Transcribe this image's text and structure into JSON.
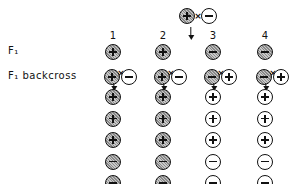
{
  "diagram": {
    "parents": [
      {
        "sign": "+",
        "fill": "shaded"
      },
      {
        "sign": "-",
        "fill": "open"
      }
    ],
    "cross_symbol": "×",
    "row_labels": {
      "f1": "F₁",
      "f1_backcross": "F₁ backcross"
    },
    "columns": [
      {
        "number": "1",
        "f1": {
          "sign": "+",
          "fill": "shaded"
        },
        "backcross": [
          {
            "sign": "+",
            "fill": "shaded"
          },
          {
            "sign": "-",
            "fill": "open"
          }
        ],
        "progeny": [
          {
            "sign": "+",
            "fill": "shaded"
          },
          {
            "sign": "+",
            "fill": "shaded"
          },
          {
            "sign": "+",
            "fill": "shaded"
          },
          {
            "sign": "-",
            "fill": "shaded"
          },
          {
            "sign": "-",
            "fill": "shaded"
          }
        ]
      },
      {
        "number": "2",
        "f1": {
          "sign": "+",
          "fill": "shaded"
        },
        "backcross": [
          {
            "sign": "+",
            "fill": "shaded"
          },
          {
            "sign": "-",
            "fill": "open"
          }
        ],
        "progeny": [
          {
            "sign": "+",
            "fill": "shaded"
          },
          {
            "sign": "+",
            "fill": "shaded"
          },
          {
            "sign": "+",
            "fill": "shaded"
          },
          {
            "sign": "-",
            "fill": "shaded"
          },
          {
            "sign": "-",
            "fill": "shaded"
          }
        ]
      },
      {
        "number": "3",
        "f1": {
          "sign": "-",
          "fill": "shaded"
        },
        "backcross": [
          {
            "sign": "-",
            "fill": "shaded"
          },
          {
            "sign": "+",
            "fill": "open"
          }
        ],
        "progeny": [
          {
            "sign": "+",
            "fill": "open"
          },
          {
            "sign": "+",
            "fill": "open"
          },
          {
            "sign": "+",
            "fill": "open"
          },
          {
            "sign": "-",
            "fill": "open"
          },
          {
            "sign": "-",
            "fill": "open"
          }
        ]
      },
      {
        "number": "4",
        "f1": {
          "sign": "-",
          "fill": "shaded"
        },
        "backcross": [
          {
            "sign": "-",
            "fill": "shaded"
          },
          {
            "sign": "+",
            "fill": "open"
          }
        ],
        "progeny": [
          {
            "sign": "+",
            "fill": "open"
          },
          {
            "sign": "+",
            "fill": "open"
          },
          {
            "sign": "+",
            "fill": "open"
          },
          {
            "sign": "-",
            "fill": "open"
          },
          {
            "sign": "-",
            "fill": "open"
          }
        ]
      }
    ]
  }
}
